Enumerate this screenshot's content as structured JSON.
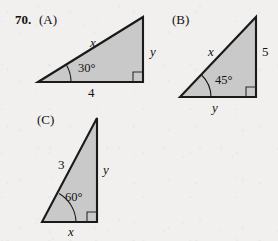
{
  "problem": {
    "number": "70."
  },
  "colors": {
    "page_background": "#f1f0ee",
    "triangle_fill": "#c9c9c9",
    "triangle_stroke": "#1a1a1a",
    "text": "#111111"
  },
  "figures": [
    {
      "tag": "(A)",
      "angle": "30°",
      "hypotenuse_label": "x",
      "vertical_label": "y",
      "base_label": "4",
      "right_angle_marker": "square"
    },
    {
      "tag": "(B)",
      "angle": "45°",
      "hypotenuse_label": "x",
      "vertical_label": "5",
      "base_label": "y",
      "right_angle_marker": "square"
    },
    {
      "tag": "(C)",
      "angle": "60°",
      "hypotenuse_label": "3",
      "vertical_label": "y",
      "base_label": "x",
      "right_angle_marker": "square"
    }
  ]
}
